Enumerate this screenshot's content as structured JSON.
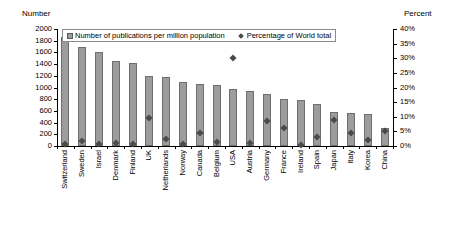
{
  "chart_data": {
    "type": "bar",
    "title": "",
    "subtitle": "",
    "xlabel": "",
    "ylabel": "Number",
    "ylabel_right": "Percent",
    "ylim": [
      0,
      2000
    ],
    "ylim_right": [
      0,
      40
    ],
    "grid": false,
    "legend_position": "top-inside-left",
    "categories": [
      "Switzerland",
      "Sweden",
      "Israel",
      "Denmark",
      "Finland",
      "UK",
      "Netherlands",
      "Norway",
      "Canada",
      "Belgium",
      "USA",
      "Austria",
      "Germany",
      "France",
      "Ireland",
      "Spain",
      "Japan",
      "Italy",
      "Korea",
      "China"
    ],
    "yticks": [
      0,
      200,
      400,
      600,
      800,
      1000,
      1200,
      1400,
      1600,
      1800,
      2000
    ],
    "ytick_labels": [
      "0",
      "200",
      "400",
      "600",
      "800",
      "1000",
      "1200",
      "1400",
      "1600",
      "1800",
      "2000"
    ],
    "yticks_right": [
      0,
      5,
      10,
      15,
      20,
      25,
      30,
      35,
      40
    ],
    "ytick_labels_right": [
      "0%",
      "5%",
      "10%",
      "15%",
      "20%",
      "25%",
      "30%",
      "35%",
      "40%"
    ],
    "series": [
      {
        "name": "Number of publications per million population",
        "type": "bar",
        "axis": "left",
        "color": "#9c9c9c",
        "values": [
          1870,
          1690,
          1610,
          1450,
          1420,
          1195,
          1185,
          1100,
          1065,
          1040,
          970,
          935,
          890,
          810,
          795,
          725,
          575,
          565,
          555,
          305
        ]
      },
      {
        "name": "Percentage of World total",
        "type": "scatter",
        "axis": "right",
        "color": "#4a4a4a",
        "values": [
          0.6,
          1.8,
          0.7,
          1.1,
          0.8,
          9.5,
          2.5,
          0.7,
          4.5,
          1.3,
          30.0,
          1.0,
          8.5,
          6.0,
          0.5,
          3.0,
          9.0,
          4.5,
          2.0,
          5.0
        ]
      }
    ]
  },
  "axes": {
    "left_title": "Number",
    "right_title": "Percent"
  },
  "legend": {
    "entries": [
      {
        "label": "Number of publications per million population",
        "marker": "square-swatch"
      },
      {
        "label": "Percentage of World total",
        "marker": "diamond-swatch"
      }
    ]
  }
}
